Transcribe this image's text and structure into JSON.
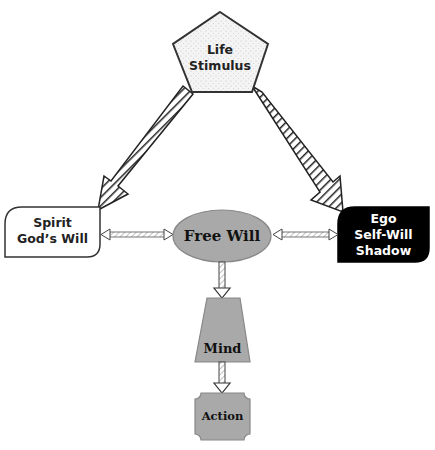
{
  "diagram": {
    "nodes": {
      "life_stimulus": {
        "line1": "Life",
        "line2": "Stimulus"
      },
      "spirit": {
        "line1": "Spirit",
        "line2": "God’s Will"
      },
      "free_will": {
        "label": "Free Will"
      },
      "ego": {
        "line1": "Ego",
        "line2": "Self-Will",
        "line3": "Shadow"
      },
      "mind": {
        "label": "Mind"
      },
      "action": {
        "label": "Action"
      }
    },
    "edges": [
      {
        "from": "Life Stimulus",
        "to": "Spirit",
        "style": "hatched"
      },
      {
        "from": "Life Stimulus",
        "to": "Ego",
        "style": "hatched"
      },
      {
        "from": "Free Will",
        "to": "Spirit",
        "style": "double-headed"
      },
      {
        "from": "Free Will",
        "to": "Ego",
        "style": "double-headed"
      },
      {
        "from": "Free Will",
        "to": "Mind",
        "style": "hollow"
      },
      {
        "from": "Mind",
        "to": "Action",
        "style": "hollow"
      }
    ],
    "colors": {
      "node_gray": "#a9a9a9",
      "ego_fill": "#000000",
      "stroke": "#333333",
      "pentagon_fill": "#f4f4f4"
    }
  }
}
